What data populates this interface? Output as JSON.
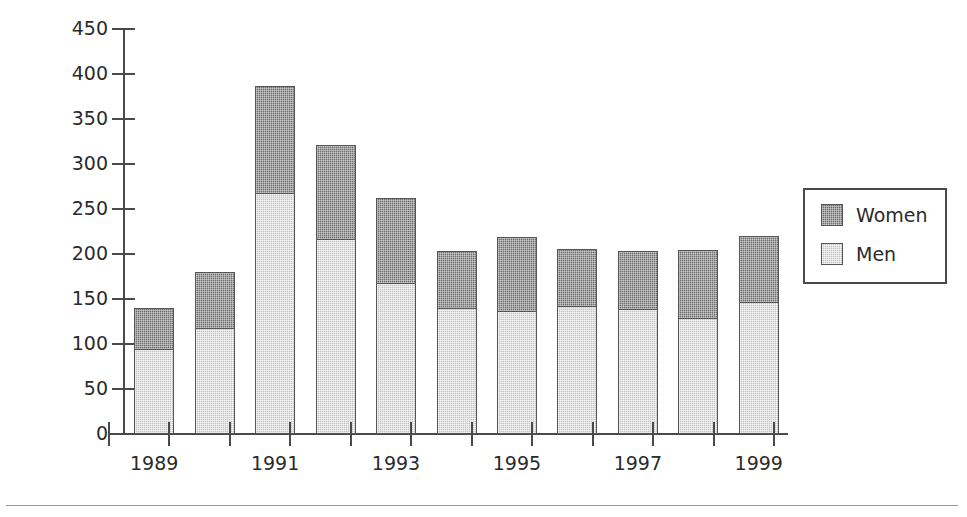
{
  "chart_data": {
    "type": "bar",
    "title": "",
    "subtitle": "",
    "xlabel": "",
    "ylabel": "(1000s)",
    "stacked": true,
    "grid": false,
    "legend_position": "right",
    "ylim": [
      0,
      450
    ],
    "ytick_step": 50,
    "ytick_labels": [
      "450",
      "400",
      "350",
      "300",
      "250",
      "200",
      "150",
      "100",
      "50",
      "0"
    ],
    "ytick_values": [
      450,
      400,
      350,
      300,
      250,
      200,
      150,
      100,
      50,
      0
    ],
    "categories": [
      1989,
      1990,
      1991,
      1992,
      1993,
      1994,
      1995,
      1996,
      1997,
      1998,
      1999
    ],
    "xtick_labels": [
      "1989",
      "1991",
      "1993",
      "1995",
      "1997",
      "1999"
    ],
    "xtick_label_years": [
      1989,
      1991,
      1993,
      1995,
      1997,
      1999
    ],
    "series": [
      {
        "name": "Men",
        "color": "#c3c3c3",
        "values": [
          94,
          118,
          268,
          217,
          168,
          140,
          137,
          142,
          139,
          129,
          147
        ]
      },
      {
        "name": "Women",
        "color": "#6e6e6e",
        "values": [
          47,
          63,
          120,
          105,
          95,
          64,
          83,
          65,
          65,
          77,
          74
        ]
      }
    ],
    "totals": [
      141,
      181,
      388,
      322,
      263,
      204,
      220,
      207,
      204,
      206,
      221
    ]
  },
  "legend": {
    "entries": [
      {
        "label": "Women",
        "color": "#6e6e6e"
      },
      {
        "label": "Men",
        "color": "#c3c3c3"
      }
    ]
  },
  "axis": {
    "y_title": "(1000s)"
  },
  "colors": {
    "axis": "#4a4a4a",
    "text": "#2b2b2b",
    "men": "#c3c3c3",
    "women": "#6e6e6e",
    "background": "#ffffff",
    "rule": "#9a9a9a"
  }
}
